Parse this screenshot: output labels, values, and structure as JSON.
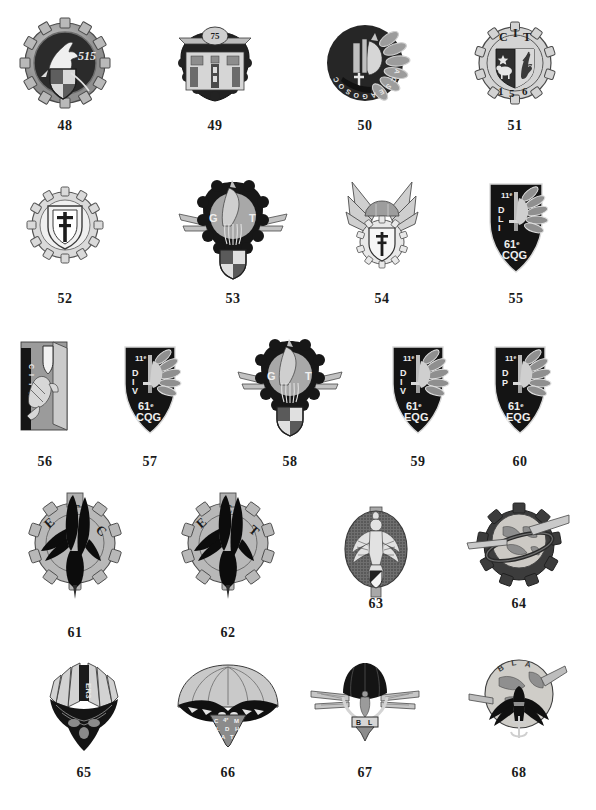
{
  "plate": {
    "kind": "insignia-catalog-plate",
    "background_color": "#ffffff",
    "ink_color": "#1b1b1b",
    "columns": 4,
    "rows": 5,
    "caption_font_style": "bold-serif",
    "total_items": 21
  },
  "items": [
    {
      "number": "48",
      "row": 1,
      "col": 1,
      "cx": 65,
      "cy": 63,
      "w": 86,
      "h": 92,
      "caption_y": 119,
      "shape": "gear-disc",
      "description": "Toothed gear ring enclosing dark disc with rearing horse and quartered shield",
      "inscriptions": [
        "515"
      ],
      "tone": "mixed-light-dark"
    },
    {
      "number": "49",
      "row": 1,
      "col": 2,
      "cx": 215,
      "cy": 63,
      "w": 74,
      "h": 84,
      "caption_y": 119,
      "shape": "gear-disc-with-banner",
      "description": "Dark scalloped disc with heraldic city arms panel and top banner",
      "inscriptions": [
        "75"
      ],
      "tone": "dark"
    },
    {
      "number": "50",
      "row": 1,
      "col": 3,
      "cx": 365,
      "cy": 63,
      "w": 84,
      "h": 84,
      "caption_y": 119,
      "shape": "wreath-disc",
      "description": "Laurel wreath disc with horse head, sword and vertical lettering around rim",
      "inscriptions": [
        "COS",
        "O",
        "GA",
        "ESCA"
      ],
      "tone": "mixed"
    },
    {
      "number": "51",
      "row": 1,
      "col": 4,
      "cx": 515,
      "cy": 63,
      "w": 78,
      "h": 82,
      "caption_y": 119,
      "shape": "gear-disc",
      "description": "Light gear ring with party-per-pale shield: lamb and rampant lion",
      "inscriptions": [
        "C",
        "I",
        "T",
        "1",
        "5",
        "6"
      ],
      "tone": "light"
    },
    {
      "number": "52",
      "row": 2,
      "col": 1,
      "cx": 65,
      "cy": 225,
      "w": 78,
      "h": 80,
      "caption_y": 292,
      "shape": "gear-disc",
      "description": "Light gear ring enclosing shield charged with Cross of Lorraine",
      "inscriptions": [],
      "tone": "light"
    },
    {
      "number": "53",
      "row": 2,
      "col": 2,
      "cx": 233,
      "cy": 230,
      "w": 112,
      "h": 100,
      "caption_y": 292,
      "shape": "winged-gear-shield",
      "description": "Dark winged gear with pegasus and flame, quartered shield pendant below",
      "inscriptions": [
        "G",
        "T"
      ],
      "tone": "dark"
    },
    {
      "number": "54",
      "row": 2,
      "col": 3,
      "cx": 382,
      "cy": 228,
      "w": 86,
      "h": 96,
      "caption_y": 292,
      "shape": "winged-parachute-gear",
      "description": "Outspread wings with parachute dome over gear ring and Cross of Lorraine shield",
      "inscriptions": [],
      "tone": "light"
    },
    {
      "number": "55",
      "row": 2,
      "col": 4,
      "cx": 516,
      "cy": 228,
      "w": 74,
      "h": 96,
      "caption_y": 292,
      "shape": "shield-with-wing",
      "description": "Dark shield with upright sword, feathered wing and horse head",
      "inscriptions": [
        "11e",
        "D.L.I",
        "61e",
        "CQG"
      ],
      "tone": "dark"
    },
    {
      "number": "56",
      "row": 3,
      "col": 1,
      "cx": 45,
      "cy": 388,
      "w": 70,
      "h": 96,
      "caption_y": 455,
      "shape": "vertical-panel",
      "description": "Upright rectangular panel with rampant lion, dark vertical lettering band at left",
      "inscriptions": [
        "C I T H"
      ],
      "tone": "mixed"
    },
    {
      "number": "57",
      "row": 3,
      "col": 2,
      "cx": 150,
      "cy": 390,
      "w": 72,
      "h": 94,
      "caption_y": 455,
      "shape": "shield-with-wing",
      "description": "Dark shield with sword, feathered wing and horse head",
      "inscriptions": [
        "11e",
        "D.I.V",
        "61e",
        "CQG"
      ],
      "tone": "dark"
    },
    {
      "number": "58",
      "row": 3,
      "col": 3,
      "cx": 290,
      "cy": 388,
      "w": 108,
      "h": 100,
      "caption_y": 455,
      "shape": "winged-gear-shield",
      "description": "Dark winged gear with pegasus and flame, shield pendant below",
      "inscriptions": [
        "G",
        "T"
      ],
      "tone": "dark"
    },
    {
      "number": "59",
      "row": 3,
      "col": 4,
      "cx": 418,
      "cy": 390,
      "w": 72,
      "h": 94,
      "caption_y": 455,
      "shape": "shield-with-wing",
      "description": "Dark shield with sword, feathered wing and horse head",
      "inscriptions": [
        "11e",
        "D.I.V",
        "61e",
        "EQG"
      ],
      "tone": "dark"
    },
    {
      "number": "60",
      "row": 3,
      "col": 4,
      "cx": 520,
      "cy": 390,
      "w": 72,
      "h": 94,
      "caption_y": 455,
      "shape": "shield-with-wing",
      "description": "Dark shield with sword, feathered wing and horse head",
      "inscriptions": [
        "11e",
        "D.P",
        "61e",
        "EQG"
      ],
      "tone": "dark"
    },
    {
      "number": "61",
      "row": 4,
      "col": 1,
      "cx": 75,
      "cy": 552,
      "w": 104,
      "h": 118,
      "caption_y": 626,
      "shape": "gear-with-eagle",
      "description": "Large cogwheel with black diving eagle and pointed drop finial",
      "inscriptions": [
        "E",
        "T",
        "C"
      ],
      "tone": "mixed"
    },
    {
      "number": "62",
      "row": 4,
      "col": 2,
      "cx": 228,
      "cy": 552,
      "w": 104,
      "h": 118,
      "caption_y": 626,
      "shape": "gear-with-eagle",
      "description": "Large cogwheel with black diving eagle and pointed drop finial",
      "inscriptions": [
        "E",
        "C",
        "T",
        "1"
      ],
      "tone": "mixed"
    },
    {
      "number": "63",
      "row": 4,
      "col": 3,
      "cx": 376,
      "cy": 555,
      "w": 72,
      "h": 96,
      "caption_y": 597,
      "shape": "oval-plaque",
      "description": "Stippled oval plaque with spread eagle over small striped shield",
      "inscriptions": [],
      "tone": "mixed"
    },
    {
      "number": "64",
      "row": 4,
      "col": 4,
      "cx": 519,
      "cy": 545,
      "w": 104,
      "h": 92,
      "caption_y": 597,
      "shape": "winged-globe-gear",
      "description": "Winged globe over dark cogwheel with orbital ring",
      "inscriptions": [],
      "tone": "mixed"
    },
    {
      "number": "65",
      "row": 5,
      "col": 1,
      "cx": 84,
      "cy": 707,
      "w": 84,
      "h": 96,
      "caption_y": 766,
      "shape": "parachute-cluster",
      "description": "Ribbed parachute canopy over dark winged cluster with vertical inscription",
      "inscriptions": [
        "ER3"
      ],
      "tone": "dark"
    },
    {
      "number": "66",
      "row": 5,
      "col": 2,
      "cx": 228,
      "cy": 705,
      "w": 118,
      "h": 92,
      "caption_y": 766,
      "shape": "parachute-with-triangle",
      "description": "Wide parachute canopy with black eagle and inverted triangle shield",
      "inscriptions": [
        "C",
        "4e",
        "M",
        "L",
        "D",
        "H",
        "A",
        "T"
      ],
      "tone": "mixed"
    },
    {
      "number": "67",
      "row": 5,
      "col": 3,
      "cx": 365,
      "cy": 705,
      "w": 110,
      "h": 92,
      "caption_y": 766,
      "shape": "winged-parachute",
      "description": "Straight horizontal wings with dark parachute canopy and pendant badge",
      "inscriptions": [
        "B",
        "L"
      ],
      "tone": "mixed"
    },
    {
      "number": "68",
      "row": 5,
      "col": 4,
      "cx": 519,
      "cy": 700,
      "w": 104,
      "h": 96,
      "caption_y": 766,
      "shape": "winged-globe-eagle",
      "description": "Globe with wings and dark spread eagle clutching anchor-cross",
      "inscriptions": [
        "B.L.A"
      ],
      "tone": "mixed"
    }
  ]
}
